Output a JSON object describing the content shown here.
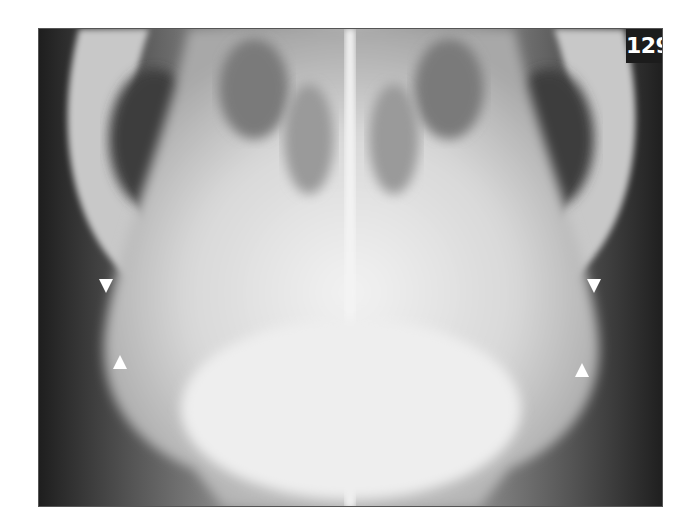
{
  "figure": {
    "number_label": "129",
    "arrowheads": [
      {
        "direction": "down",
        "x": 106,
        "y": 286
      },
      {
        "direction": "up",
        "x": 120,
        "y": 362
      },
      {
        "direction": "down",
        "x": 594,
        "y": 286
      },
      {
        "direction": "up",
        "x": 582,
        "y": 370
      }
    ],
    "colors": {
      "background": "#ffffff",
      "label_bg": "#1c1c1c",
      "label_text": "#ffffff",
      "arrow": "#ffffff"
    }
  }
}
